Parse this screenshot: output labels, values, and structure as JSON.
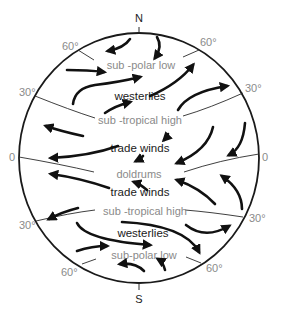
{
  "diagram": {
    "type": "global-wind-circulation",
    "poles": {
      "north": "N",
      "south": "S"
    },
    "latitude_labels": {
      "n60_left": "60°",
      "n60_right": "60°",
      "n30_left": "30°",
      "n30_right": "30°",
      "eq_left": "0",
      "eq_right": "0",
      "s30_left": "30°",
      "s30_right": "30°",
      "s60_left": "60°",
      "s60_right": "60°"
    },
    "pressure_belts": {
      "north_subpolar": "sub -polar low",
      "north_subtropical": "sub -tropical high",
      "equator": "doldrums",
      "south_subtropical": "sub -tropical high",
      "south_subpolar": "sub-polar low"
    },
    "wind_belts": {
      "north_westerlies": "westerlies",
      "north_trades": "trade winds",
      "south_trades": "trade winds",
      "south_westerlies": "westerlies"
    },
    "colors": {
      "outline": "#1a1a1a",
      "label_gray": "#8a8a8a",
      "arrow": "#111111"
    }
  }
}
